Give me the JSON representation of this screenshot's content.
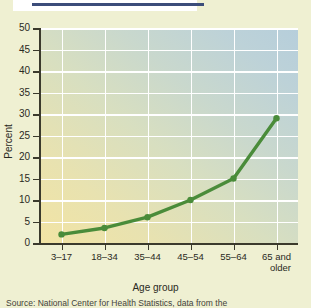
{
  "figure": {
    "top_rule_color": "#3c4d7a",
    "page_background": "#eff0d2"
  },
  "chart_data": {
    "type": "line",
    "title": "",
    "subtitle": "",
    "categories": [
      "3–17",
      "18–34",
      "35–44",
      "45–54",
      "55–64",
      "65 and\nolder"
    ],
    "category_labels": [
      {
        "line1": "3–17",
        "line2": ""
      },
      {
        "line1": "18–34",
        "line2": ""
      },
      {
        "line1": "35–44",
        "line2": ""
      },
      {
        "line1": "45–54",
        "line2": ""
      },
      {
        "line1": "55–64",
        "line2": ""
      },
      {
        "line1": "65 and",
        "line2": "older"
      }
    ],
    "values": [
      2,
      3.5,
      6,
      10,
      15,
      29
    ],
    "series": [
      {
        "name": "Percent",
        "values": [
          2,
          3.5,
          6,
          10,
          15,
          29
        ],
        "color": "#4a8c3a"
      }
    ],
    "xlabel": "Age group",
    "ylabel": "Percent",
    "ylim": [
      0,
      50
    ],
    "ytick_labels": [
      "0",
      "5",
      "10",
      "15",
      "20",
      "25",
      "30",
      "35",
      "40",
      "45",
      "50"
    ],
    "ytick_values": [
      0,
      5,
      10,
      15,
      20,
      25,
      30,
      35,
      40,
      45,
      50
    ],
    "grid": true,
    "gridline_color": "#ffffff",
    "legend": "none",
    "marker": "circle",
    "line_color": "#4a8c3a",
    "plot_gradient_from": "#f2e4a4",
    "plot_gradient_to": "#b6cedb"
  },
  "source": {
    "note": "Source: National Center for Health Statistics, data from the"
  }
}
